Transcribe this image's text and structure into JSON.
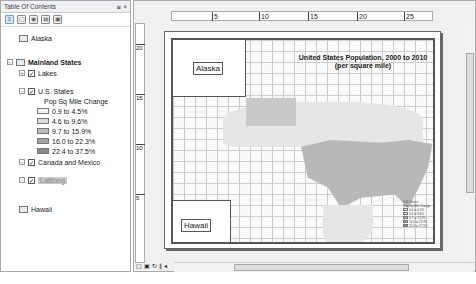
{
  "toc": {
    "title": "Table Of Contents",
    "pin": "⩏",
    "close": "×",
    "toolbar": [
      "list-by-drawing-order",
      "list-by-source",
      "list-by-visibility",
      "list-by-selection",
      "options"
    ],
    "items": [
      {
        "label": "Alaska",
        "type": "dataframe"
      },
      {
        "label": "Mainland States",
        "type": "dataframe",
        "bold": true
      },
      {
        "label": "Lakes",
        "type": "layer",
        "checked": true
      },
      {
        "label": "U.S. States",
        "type": "layer",
        "checked": true
      },
      {
        "label": "Pop Sq Mile Change",
        "type": "heading"
      },
      {
        "label": "0.9 to 4.5%",
        "color": "#f4f4f4"
      },
      {
        "label": "4.6 to 9.6%",
        "color": "#dcdcdc"
      },
      {
        "label": "9.7 to 15.9%",
        "color": "#bdbdbd"
      },
      {
        "label": "16.0 to 22.3%",
        "color": "#a3a3a3"
      },
      {
        "label": "22.4 to 37.5%",
        "color": "#8a8a8a"
      },
      {
        "label": "Canada and Mexico",
        "type": "layer",
        "checked": true
      },
      {
        "label": "Lattlong",
        "type": "layer",
        "checked": true,
        "selected": true
      },
      {
        "label": "Hawaii",
        "type": "dataframe"
      }
    ]
  },
  "map": {
    "ruler_h": [
      "5",
      "10",
      "15",
      "20",
      "25"
    ],
    "ruler_v": [
      "20",
      "15",
      "10",
      "5"
    ],
    "title_line1": "United States Population, 2000 to 2010",
    "title_line2": "(per square mile)",
    "inset_alaska": "Alaska",
    "inset_hawaii": "Hawaii",
    "legend_title": "U.S. States",
    "legend_sub": "Pop Sq Mile Change",
    "legend": [
      "0.9 to 4.5%",
      "4.6 to 9.6%",
      "9.7 to 15.9%",
      "16.0 to 22.3%",
      "22.4 to 37.5%"
    ]
  }
}
